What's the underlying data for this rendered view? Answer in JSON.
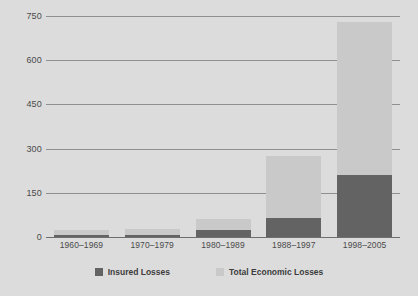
{
  "chart_data": {
    "type": "bar",
    "subtype": "stacked",
    "title": "",
    "xlabel": "",
    "ylabel": "",
    "categories": [
      "1960–1969",
      "1970–1979",
      "1980–1989",
      "1988–1997",
      "1998–2005"
    ],
    "series": [
      {
        "name": "Insured Losses",
        "color": "#636363",
        "values": [
          7,
          7,
          25,
          65,
          210
        ]
      },
      {
        "name": "Total Economic Losses",
        "color": "#c9c9c9",
        "values": [
          25,
          27,
          60,
          275,
          730
        ]
      }
    ],
    "ylim": [
      0,
      750
    ],
    "yticks": [
      0,
      150,
      300,
      450,
      600,
      750
    ],
    "ytick_labels": [
      "0",
      "150",
      "300",
      "450",
      "600",
      "750"
    ],
    "grid": true,
    "legend_position": "bottom"
  },
  "legend": {
    "items": [
      {
        "label": "Insured Losses",
        "color": "#636363"
      },
      {
        "label": "Total Economic Losses",
        "color": "#c9c9c9"
      }
    ]
  },
  "colors": {
    "background": "#dcdcdc",
    "gridline": "#8f8f8f",
    "axis": "#6e6e6e",
    "insured": "#636363",
    "total": "#c9c9c9",
    "text": "#4a4a4a"
  }
}
